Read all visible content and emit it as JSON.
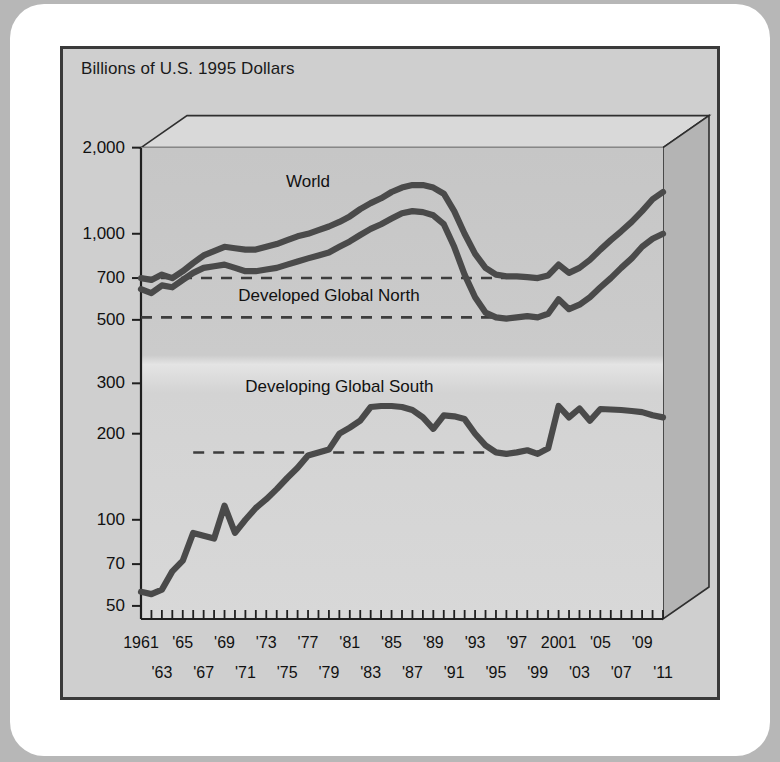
{
  "figure": {
    "axis_title": "Billions of U.S. 1995 Dollars",
    "source_note": "1961–1994, U.S. ACDA (1998): 1; 1995–2009, SIPRI Yearbooks.",
    "background_color": "#cfcfcf",
    "card_color": "#ffffff",
    "page_color": "#b7b7b7",
    "line_color": "#4a4a4a",
    "frame_color": "#3a3a3a"
  },
  "chart_data": {
    "type": "line",
    "title": "Billions of U.S. 1995 Dollars",
    "xlabel": "",
    "ylabel": "Billions of U.S. 1995 Dollars",
    "yscale": "log",
    "ylim": [
      45,
      2400
    ],
    "xlim": [
      1961,
      2011
    ],
    "grid": false,
    "legend": "inline-annotations",
    "ytick_labels": [
      "2,000",
      "1,000",
      "700",
      "500",
      "300",
      "200",
      "100",
      "70",
      "50"
    ],
    "ytick_values": [
      2000,
      1000,
      700,
      500,
      300,
      200,
      100,
      70,
      50
    ],
    "xtick_top_labels": [
      "1961",
      "'65",
      "'69",
      "'73",
      "'77",
      "'81",
      "'85",
      "'89",
      "'93",
      "'97",
      "2001",
      "'05",
      "'09"
    ],
    "xtick_top_values": [
      1961,
      1965,
      1969,
      1973,
      1977,
      1981,
      1985,
      1989,
      1993,
      1997,
      2001,
      2005,
      2009
    ],
    "xtick_bottom_labels": [
      "'63",
      "'67",
      "'71",
      "'75",
      "'79",
      "'83",
      "'87",
      "'91",
      "'95",
      "'99",
      "'03",
      "'07",
      "'11"
    ],
    "xtick_bottom_values": [
      1963,
      1967,
      1971,
      1975,
      1979,
      1983,
      1987,
      1991,
      1995,
      1999,
      2003,
      2007,
      2011
    ],
    "x": [
      1961,
      1962,
      1963,
      1964,
      1965,
      1966,
      1967,
      1968,
      1969,
      1970,
      1971,
      1972,
      1973,
      1974,
      1975,
      1976,
      1977,
      1978,
      1979,
      1980,
      1981,
      1982,
      1983,
      1984,
      1985,
      1986,
      1987,
      1988,
      1989,
      1990,
      1991,
      1992,
      1993,
      1994,
      1995,
      1996,
      1997,
      1998,
      1999,
      2000,
      2001,
      2002,
      2003,
      2004,
      2005,
      2006,
      2007,
      2008,
      2009,
      2010,
      2011
    ],
    "series": [
      {
        "name": "World",
        "label": "World",
        "values": [
          700,
          690,
          720,
          700,
          740,
          790,
          840,
          870,
          900,
          890,
          880,
          880,
          900,
          920,
          950,
          980,
          1000,
          1030,
          1060,
          1100,
          1150,
          1220,
          1280,
          1330,
          1400,
          1450,
          1480,
          1480,
          1450,
          1380,
          1200,
          1000,
          850,
          760,
          720,
          710,
          710,
          705,
          700,
          715,
          780,
          730,
          760,
          810,
          880,
          950,
          1020,
          1100,
          1200,
          1320,
          1400
        ]
      },
      {
        "name": "Developed Global North",
        "label": "Developed Global North",
        "values": [
          640,
          620,
          660,
          650,
          690,
          730,
          760,
          770,
          780,
          760,
          740,
          740,
          750,
          760,
          780,
          800,
          820,
          840,
          860,
          900,
          940,
          990,
          1040,
          1080,
          1130,
          1180,
          1200,
          1190,
          1160,
          1080,
          900,
          720,
          600,
          530,
          510,
          505,
          510,
          515,
          510,
          525,
          590,
          545,
          565,
          600,
          650,
          700,
          760,
          820,
          900,
          960,
          1000
        ]
      },
      {
        "name": "Developing Global South",
        "label": "Developing Global South",
        "values": [
          56,
          55,
          57,
          66,
          72,
          90,
          88,
          86,
          112,
          90,
          100,
          110,
          118,
          128,
          140,
          152,
          168,
          172,
          176,
          200,
          210,
          222,
          248,
          250,
          250,
          248,
          242,
          228,
          208,
          232,
          230,
          225,
          200,
          182,
          172,
          170,
          172,
          175,
          170,
          178,
          250,
          228,
          245,
          222,
          244,
          243,
          242,
          240,
          238,
          232,
          228
        ]
      }
    ],
    "reference_lines": [
      {
        "name": "world-reference",
        "value": 700,
        "x_start": 1961,
        "x_end": 1996,
        "style": "dashed"
      },
      {
        "name": "north-reference",
        "value": 510,
        "x_start": 1961,
        "x_end": 1996,
        "style": "dashed"
      },
      {
        "name": "south-reference",
        "value": 172,
        "x_start": 1966,
        "x_end": 1996,
        "style": "dashed"
      }
    ],
    "annotations": [
      {
        "text": "World",
        "x": 1977,
        "y": 1500
      },
      {
        "text": "Developed Global North",
        "x": 1979,
        "y": 600
      },
      {
        "text": "Developing Global South",
        "x": 1980,
        "y": 290
      }
    ]
  }
}
